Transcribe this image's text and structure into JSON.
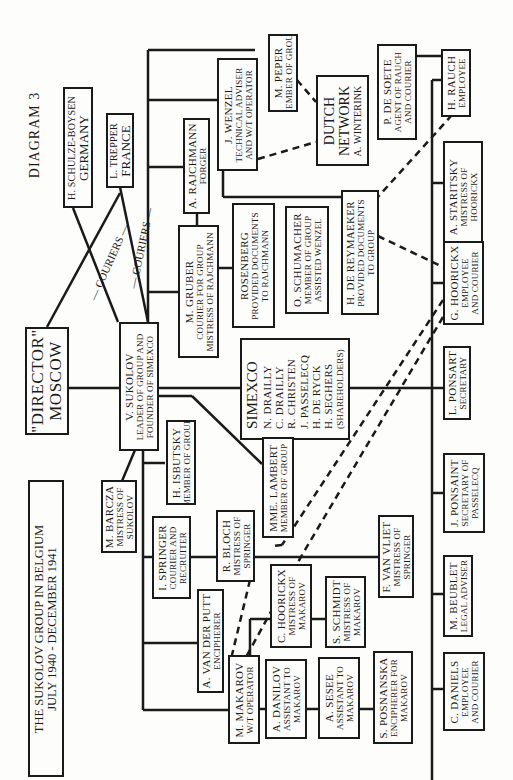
{
  "diagram": {
    "label": "DIAGRAM 3",
    "title": [
      "THE SUKOLOV GROUP IN BELGIUM",
      "JULY 1940 - DECEMBER 1941"
    ],
    "edge_labels": {
      "couriers_left": "— COURIERS —",
      "couriers_right": "— COURIERS —"
    },
    "nodes": {
      "director": {
        "lines": [
          "\"DIRECTOR\"",
          "MOSCOW"
        ]
      },
      "schulze": {
        "name": "H. SCHULZE-BOYSEN",
        "place": "GERMANY"
      },
      "trepper": {
        "name": "L. TREPPER",
        "place": "FRANCE"
      },
      "sukolov": {
        "name": "V. SUKOLOV",
        "role": [
          "LEADER OF GROUP AND",
          "FOUNDER OF SIMEXCO"
        ]
      },
      "rajchmann": {
        "name": "A. RAJCHMANN",
        "role": [
          "FORGER"
        ]
      },
      "wenzel": {
        "name": "J. WENZEL",
        "role": [
          "TECHNICAL ADVISER",
          "AND W/T OPERATOR"
        ]
      },
      "peper": {
        "name": "M. PEPER",
        "role": [
          "MEMBER OF GROUP"
        ]
      },
      "dutch": {
        "lines": [
          "DUTCH",
          "NETWORK"
        ],
        "sub": "A. WINTERINK"
      },
      "desoete": {
        "name": "P. DE SOETE",
        "role": [
          "AGENT OF RAUCH",
          "AND COURIER"
        ]
      },
      "rauch": {
        "name": "H. RAUCH",
        "role": [
          "EMPLOYEE"
        ]
      },
      "gruber": {
        "name": "M. GRUBER",
        "role": [
          "COURIER FOR GROUP",
          "MISTRESS OF RAJCHMANN"
        ]
      },
      "rosenberg": {
        "name": "ROSENBERG",
        "role": [
          "PROVIDED DOCUMENTS",
          "TO RAJCHMANN"
        ]
      },
      "schumacher": {
        "name": "O. SCHUMACHER",
        "role": [
          "MEMBER OF GROUP",
          "ASSISTED WENZEL"
        ]
      },
      "dereymaeker": {
        "name": "H. DE REYMAEKER",
        "role": [
          "PROVIDED DOCUMENTS",
          "TO GROUP"
        ]
      },
      "staritsky": {
        "name": "A. STARITSKY",
        "role": [
          "MISTRESS OF",
          "HOORICKX"
        ]
      },
      "ghoorickx": {
        "name": "G. HOORICKX",
        "role": [
          "EMPLOYEE",
          "AND COURIER"
        ]
      },
      "simexco": {
        "title": "SIMEXCO",
        "members": [
          "N. DRAILLY",
          "C. DRAILLY",
          "R. CHRISTEN",
          "J. PASSELECQ",
          "H. DE RYCK",
          "H. SEGHERS"
        ],
        "note": "(SHAREHOLDERS)"
      },
      "lponsart": {
        "name": "L. PONSART",
        "role": [
          "SECRETARY"
        ]
      },
      "isbutsky": {
        "name": "H. ISBUTSKY",
        "role": [
          "MEMBER OF GROUP"
        ]
      },
      "lambert": {
        "name": "MME. LAMBERT",
        "role": [
          "MEMBER OF GROUP"
        ]
      },
      "jponsaint": {
        "name": "J. PONSAINT",
        "role": [
          "SECRETARY OF",
          "PASSELECQ"
        ]
      },
      "barcza": {
        "name": "M. BARCZA",
        "role": [
          "MISTRESS OF",
          "SUKOLOV"
        ]
      },
      "springer": {
        "name": "I. SPRINGER",
        "role": [
          "COURIER AND",
          "RECRUITER"
        ]
      },
      "bloch": {
        "name": "R. BLOCH",
        "role": [
          "MISTRESS OF",
          "SPRINGER"
        ]
      },
      "vanvliet": {
        "name": "F. VAN VLIET",
        "role": [
          "MISTRESS OF",
          "SPRINGER"
        ]
      },
      "beublet": {
        "name": "M. BEUBLET",
        "role": [
          "LEGAL ADVISER"
        ]
      },
      "vanderputt": {
        "name": "A. VAN DER PUTT",
        "role": [
          "ENCIPHERER"
        ]
      },
      "choorickx": {
        "name": "C. HOORICKX",
        "role": [
          "MISTRESS OF",
          "MAKAROV"
        ]
      },
      "schmidt": {
        "name": "S. SCHMIDT",
        "role": [
          "MISTRESS OF",
          "MAKAROV"
        ]
      },
      "makarov": {
        "name": "M. MAKAROV",
        "role": [
          "W/T OPERATOR"
        ]
      },
      "danilov": {
        "name": "A. DANILOV",
        "role": [
          "ASSISTANT TO",
          "MAKAROV"
        ]
      },
      "sesee": {
        "name": "A. SESEE",
        "role": [
          "ASSISTANT TO",
          "MAKAROV"
        ]
      },
      "posnanska": {
        "name": "S. POSNANSKA",
        "role": [
          "ENCIPHERER FOR",
          "MAKAROV"
        ]
      },
      "daniels": {
        "name": "C. DANIELS",
        "role": [
          "EMPLOYEE",
          "AND COURIER"
        ]
      }
    }
  }
}
